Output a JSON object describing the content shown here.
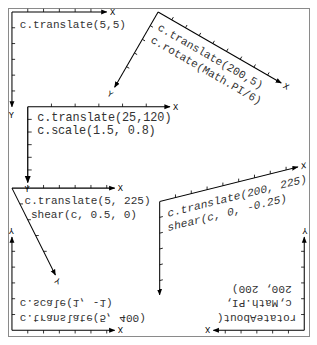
{
  "colors": {
    "background": "#ffffff",
    "border": "#8a8a8a",
    "axis": "#000000",
    "text": "#333333"
  },
  "axis_labels": {
    "x": "X",
    "y": "Y"
  },
  "panels": [
    {
      "id": "p1",
      "lines": [
        "c.translate(5,5)"
      ]
    },
    {
      "id": "p2",
      "lines": [
        "c.translate(200,5)",
        "c.rotate(Math.PI/6)"
      ]
    },
    {
      "id": "p3",
      "lines": [
        "c.translate(25,120)",
        "c.scale(1.5, 0.8)"
      ]
    },
    {
      "id": "p4",
      "lines": [
        "c.translate(5, 225)",
        "shear(c, 0.5, 0)"
      ]
    },
    {
      "id": "p5",
      "lines": [
        "c.translate(200, 225)",
        "shear(c, 0, -0.25)"
      ]
    },
    {
      "id": "p6",
      "lines": [
        "c.translate(5, 400)",
        "c.scale(1, -1)"
      ]
    },
    {
      "id": "p7",
      "lines": [
        "rotateAbout(",
        "c,Math.PI,",
        "200, 200)"
      ]
    }
  ]
}
